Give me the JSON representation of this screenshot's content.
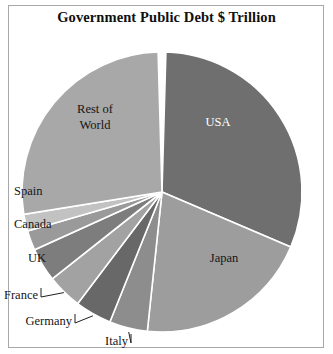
{
  "chart": {
    "title": "Government Public Debt $ Trillion",
    "frame_border_color": "#a8a8a8",
    "background": "#ffffff"
  },
  "chart_data": {
    "type": "pie",
    "title": "Government Public Debt $ Trillion",
    "xlabel": "",
    "ylabel": "",
    "legend": "none",
    "grid": false,
    "units": "$ Trillion",
    "center": [
      162,
      192
    ],
    "radius": 140,
    "start_angle_deg": -90,
    "direction": "clockwise",
    "categories": [
      "USA",
      "Japan",
      "Italy",
      "Germany",
      "France",
      "UK",
      "Canada",
      "Spain",
      "Rest of World"
    ],
    "values": [
      17.6,
      11.5,
      2.5,
      2.4,
      2.3,
      2.2,
      1.3,
      1.1,
      15.4
    ],
    "slices": [
      {
        "label": "USA",
        "value": 17.6,
        "percent": 31.4,
        "color": "#6f6f6f",
        "label_color": "#ffffff",
        "label_pos": [
          218,
          126
        ],
        "label_placement": "inside",
        "leader": false
      },
      {
        "label": "Japan",
        "value": 11.5,
        "percent": 20.5,
        "color": "#9d9d9d",
        "label_color": "#151515",
        "label_pos": [
          224,
          262
        ],
        "label_placement": "inside",
        "leader": false
      },
      {
        "label": "Italy",
        "value": 2.5,
        "percent": 4.5,
        "color": "#8d8d8d",
        "label_color": "#151515",
        "label_pos": [
          128,
          345
        ],
        "label_placement": "outside",
        "leader": true
      },
      {
        "label": "Germany",
        "value": 2.4,
        "percent": 4.3,
        "color": "#686868",
        "label_color": "#151515",
        "label_pos": [
          72,
          325
        ],
        "label_placement": "outside",
        "leader": true
      },
      {
        "label": "France",
        "value": 2.3,
        "percent": 4.1,
        "color": "#a2a2a2",
        "label_color": "#151515",
        "label_pos": [
          38,
          299
        ],
        "label_placement": "outside",
        "leader": true
      },
      {
        "label": "UK",
        "value": 2.2,
        "percent": 3.9,
        "color": "#7d7d7d",
        "label_color": "#151515",
        "label_pos": [
          46,
          262
        ],
        "label_placement": "outside",
        "leader": false
      },
      {
        "label": "Canada",
        "value": 1.3,
        "percent": 2.3,
        "color": "#9a9a9a",
        "label_color": "#151515",
        "label_pos": [
          14,
          228
        ],
        "label_placement": "outside",
        "leader": false
      },
      {
        "label": "Spain",
        "value": 1.1,
        "percent": 2.0,
        "color": "#c2c2c2",
        "label_color": "#151515",
        "label_pos": [
          14,
          195
        ],
        "label_placement": "outside",
        "leader": false
      },
      {
        "label": "Rest of World",
        "value": 15.4,
        "percent": 27.0,
        "color": "#a8a8a8",
        "label_color": "#151515",
        "label_pos": [
          95,
          113
        ],
        "label_placement": "inside",
        "leader": false
      }
    ],
    "labels_lines": {
      "rest_of_world_line1": "Rest of",
      "rest_of_world_line2": "World"
    }
  }
}
